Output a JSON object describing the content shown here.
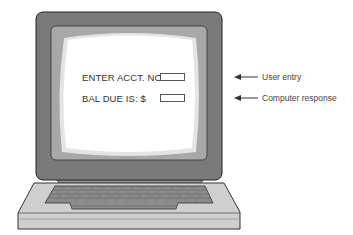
{
  "screen": {
    "prompt_label": "ENTER ACCT. NO:",
    "response_label": "BAL DUE IS:  $"
  },
  "annotations": [
    {
      "label": "User entry",
      "icon": "left-arrow-icon"
    },
    {
      "label": "Computer response",
      "icon": "left-arrow-icon"
    }
  ],
  "colors": {
    "bezel": "#7a7a7a",
    "inner_frame": "#9a9a9a",
    "screen_edge": "#c9c9c9",
    "screen": "#ffffff",
    "keyboard_base": "#cfcfcf",
    "keys": "#8a8a8a"
  }
}
